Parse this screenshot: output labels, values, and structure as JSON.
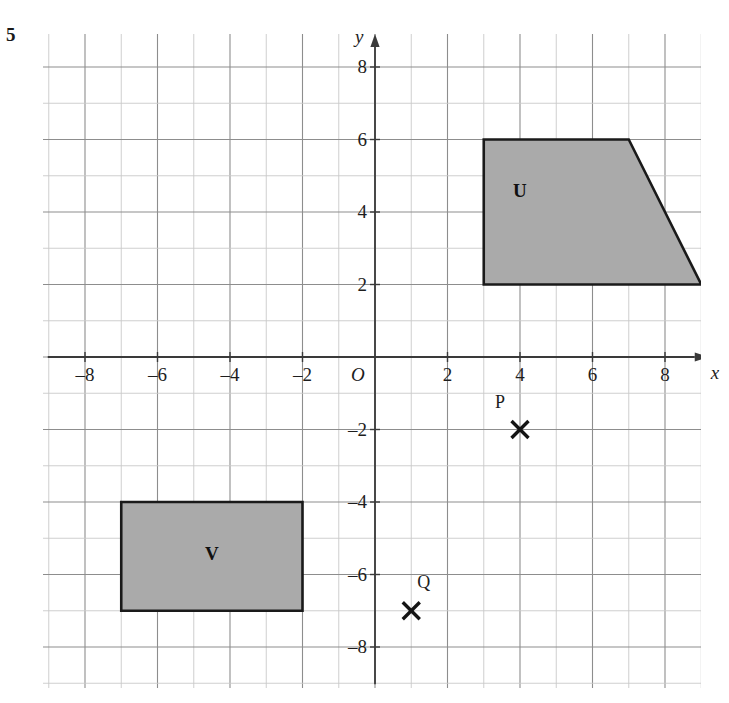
{
  "question_number": "5",
  "axes": {
    "x_axis_label": "x",
    "y_axis_label": "y",
    "origin_label": "O",
    "x_ticks": [
      {
        "value": -8,
        "label": "–8"
      },
      {
        "value": -6,
        "label": "–6"
      },
      {
        "value": -4,
        "label": "–4"
      },
      {
        "value": -2,
        "label": "–2"
      },
      {
        "value": 2,
        "label": "2"
      },
      {
        "value": 4,
        "label": "4"
      },
      {
        "value": 6,
        "label": "6"
      },
      {
        "value": 8,
        "label": "8"
      }
    ],
    "y_ticks": [
      {
        "value": 8,
        "label": "8"
      },
      {
        "value": 6,
        "label": "6"
      },
      {
        "value": 4,
        "label": "4"
      },
      {
        "value": 2,
        "label": "2"
      },
      {
        "value": -2,
        "label": "–2"
      },
      {
        "value": -4,
        "label": "–4"
      },
      {
        "value": -6,
        "label": "–6"
      },
      {
        "value": -8,
        "label": "–8"
      }
    ],
    "x_range": [
      -9,
      9
    ],
    "y_range": [
      -9,
      9
    ],
    "grid": true
  },
  "shapes": [
    {
      "name": "U",
      "label": "U",
      "type": "trapezium",
      "vertices": [
        [
          3,
          2
        ],
        [
          3,
          6
        ],
        [
          7,
          6
        ],
        [
          9,
          2
        ]
      ],
      "label_position": [
        4,
        4.6
      ],
      "fill": "#aaaaaa",
      "stroke": "#1a1a1a"
    },
    {
      "name": "V",
      "label": "V",
      "type": "rectangle",
      "vertices": [
        [
          -7,
          -4
        ],
        [
          -2,
          -4
        ],
        [
          -2,
          -7
        ],
        [
          -7,
          -7
        ]
      ],
      "label_position": [
        -4.5,
        -5.4
      ],
      "fill": "#aaaaaa",
      "stroke": "#1a1a1a"
    }
  ],
  "points": [
    {
      "name": "P",
      "label": "P",
      "coordinates": [
        4,
        -2
      ],
      "marker": "cross-marker",
      "label_offset": [
        -0.55,
        0.75
      ]
    },
    {
      "name": "Q",
      "label": "Q",
      "coordinates": [
        1,
        -7
      ],
      "marker": "cross-marker",
      "label_offset": [
        0.3,
        0.8
      ]
    }
  ],
  "colors": {
    "grid_minor": "#c9c9c9",
    "grid_major": "#8d8d8d",
    "axis": "#3a3a3a",
    "shape_fill": "#aaaaaa",
    "shape_stroke": "#1a1a1a",
    "text": "#1d1d1d"
  }
}
